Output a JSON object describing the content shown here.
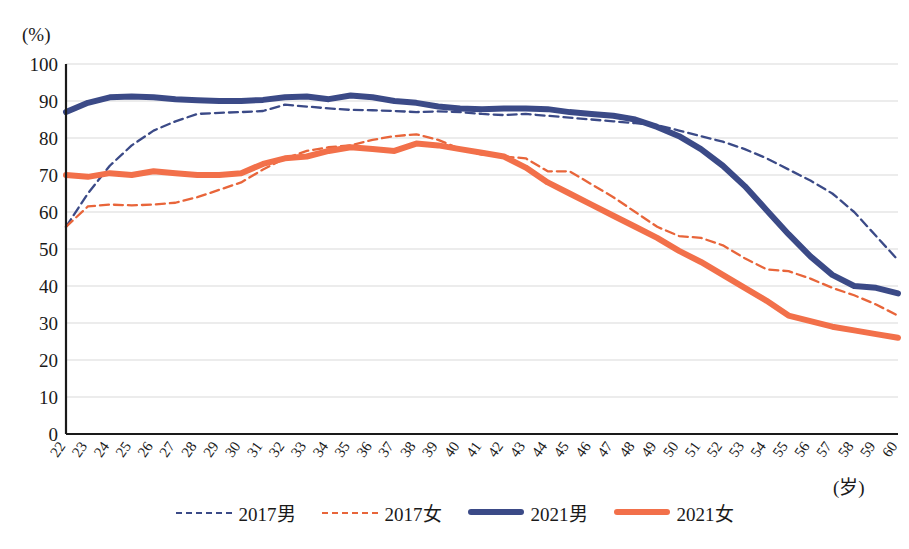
{
  "chart_data": {
    "type": "line",
    "title": "",
    "xlabel": "(岁)",
    "ylabel": "(%)",
    "xlim": [
      22,
      60
    ],
    "ylim": [
      0,
      100
    ],
    "ytick_step": 10,
    "grid": true,
    "legend_position": "bottom",
    "yticks": [
      "100",
      "90",
      "80",
      "70",
      "60",
      "50",
      "40",
      "30",
      "20",
      "10",
      "0"
    ],
    "categories": [
      22,
      23,
      24,
      25,
      26,
      27,
      28,
      29,
      30,
      31,
      32,
      33,
      34,
      35,
      36,
      37,
      38,
      39,
      40,
      41,
      42,
      43,
      44,
      45,
      46,
      47,
      48,
      49,
      50,
      51,
      52,
      53,
      54,
      55,
      56,
      57,
      58,
      59,
      60
    ],
    "series": [
      {
        "name": "2017男",
        "style": "dashed",
        "color": "#3b4a87",
        "values": [
          56.0,
          65.0,
          72.5,
          78.0,
          82.0,
          84.5,
          86.5,
          86.8,
          87.0,
          87.3,
          89.0,
          88.5,
          88.0,
          87.6,
          87.5,
          87.3,
          87.0,
          87.2,
          87.0,
          86.5,
          86.2,
          86.5,
          86.0,
          85.5,
          85.0,
          84.5,
          84.0,
          83.5,
          82.0,
          80.5,
          79.0,
          77.0,
          74.5,
          71.5,
          68.5,
          65.0,
          60.0,
          53.5,
          47.0
        ]
      },
      {
        "name": "2017女",
        "style": "dashed",
        "color": "#e8653a",
        "values": [
          56.0,
          61.5,
          62.0,
          61.8,
          62.0,
          62.5,
          64.0,
          66.0,
          68.0,
          71.5,
          74.5,
          76.5,
          77.5,
          78.0,
          79.5,
          80.5,
          81.0,
          79.5,
          77.0,
          75.5,
          75.0,
          74.5,
          71.0,
          71.0,
          67.5,
          64.0,
          60.0,
          56.0,
          53.5,
          53.0,
          51.0,
          47.5,
          44.5,
          44.0,
          42.0,
          39.5,
          37.5,
          35.0,
          32.0
        ]
      },
      {
        "name": "2021男",
        "style": "solid",
        "color": "#3b4a87",
        "values": [
          87.0,
          89.5,
          91.0,
          91.2,
          91.0,
          90.5,
          90.2,
          90.0,
          90.0,
          90.3,
          91.0,
          91.2,
          90.5,
          91.5,
          91.0,
          90.0,
          89.5,
          88.5,
          88.0,
          87.8,
          88.0,
          88.0,
          87.8,
          87.0,
          86.5,
          86.0,
          85.0,
          83.0,
          80.5,
          77.0,
          72.5,
          67.0,
          60.5,
          54.0,
          48.0,
          43.0,
          40.0,
          39.5,
          38.0
        ]
      },
      {
        "name": "2021女",
        "style": "solid",
        "color": "#f2704a",
        "values": [
          70.0,
          69.5,
          70.5,
          70.0,
          71.0,
          70.5,
          70.0,
          70.0,
          70.5,
          73.0,
          74.5,
          75.0,
          76.5,
          77.5,
          77.0,
          76.5,
          78.5,
          78.0,
          77.0,
          76.0,
          75.0,
          72.0,
          68.0,
          65.0,
          62.0,
          59.0,
          56.0,
          53.0,
          49.5,
          46.5,
          43.0,
          39.5,
          36.0,
          32.0,
          30.5,
          29.0,
          28.0,
          27.0,
          26.0
        ]
      }
    ]
  },
  "legend": {
    "items": [
      {
        "label": "2017男",
        "color": "#3b4a87",
        "style": "dashed"
      },
      {
        "label": "2017女",
        "color": "#e8653a",
        "style": "dashed"
      },
      {
        "label": "2021男",
        "color": "#3b4a87",
        "style": "solid"
      },
      {
        "label": "2021女",
        "color": "#f2704a",
        "style": "solid"
      }
    ]
  },
  "axes": {
    "y_unit": "(%)",
    "x_unit": "(岁)"
  },
  "colors": {
    "navy": "#3b4a87",
    "orange_solid": "#f2704a",
    "orange_dashed": "#e8653a",
    "grid": "#d9d9d9",
    "axis": "#1a1a1a"
  }
}
